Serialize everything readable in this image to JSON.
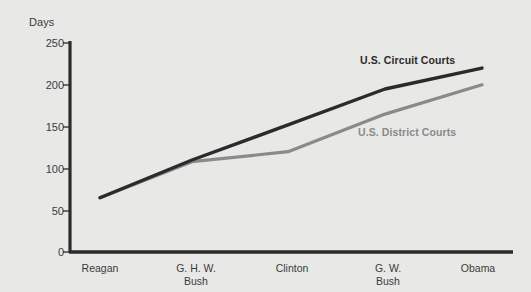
{
  "chart_data": {
    "type": "line",
    "title": "",
    "xlabel": "",
    "ylabel": "Days",
    "ylim": [
      0,
      250
    ],
    "yticks": [
      0,
      50,
      100,
      150,
      200,
      250
    ],
    "grid": false,
    "legend_position": "inline-right",
    "categories": [
      "Reagan",
      "G. H. W.\nBush",
      "Clinton",
      "G. W.\nBush",
      "Obama"
    ],
    "series": [
      {
        "name": "U.S. Circuit Courts",
        "color": "#2b2b2b",
        "values": [
          65,
          110,
          152,
          195,
          220
        ]
      },
      {
        "name": "U.S. District Courts",
        "color": "#8a8a8a",
        "values": [
          65,
          108,
          120,
          165,
          200
        ]
      }
    ]
  },
  "colors": {
    "background": "#e8e8e6",
    "axis": "#2b2b2b",
    "text": "#3b3b3b",
    "circuit": "#2b2b2b",
    "district": "#8a8a8a"
  },
  "series_labels": {
    "circuit": "U.S. Circuit Courts",
    "district": "U.S. District Courts"
  },
  "axis": {
    "y_title": "Days",
    "y_ticks": [
      "250",
      "200",
      "150",
      "100",
      "50",
      "0"
    ],
    "x_ticks": [
      "Reagan",
      "G. H. W.\nBush",
      "Clinton",
      "G. W.\nBush",
      "Obama"
    ]
  }
}
